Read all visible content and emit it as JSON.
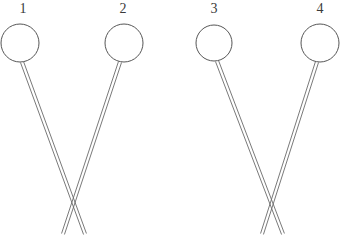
{
  "figure": {
    "background_color": "#ffffff",
    "stroke_color": "#565656",
    "stem_stroke_color": "#6a6a6a",
    "label_color": "#3a3a3a",
    "width": 356,
    "height": 235,
    "pins": [
      {
        "label": "1",
        "label_x": 17,
        "label_y": 2,
        "circle_cx": 20,
        "circle_cy": 43,
        "circle_r": 19,
        "stem_top_x": 22,
        "stem_top_y": 62,
        "stem_bottom_x": 85,
        "stem_bottom_y": 234,
        "stem_width": 3.2
      },
      {
        "label": "2",
        "label_x": 117,
        "label_y": 2,
        "circle_cx": 124,
        "circle_cy": 43,
        "circle_r": 19,
        "stem_top_x": 120,
        "stem_top_y": 62,
        "stem_bottom_x": 63,
        "stem_bottom_y": 234,
        "stem_width": 3.2
      },
      {
        "label": "3",
        "label_x": 208,
        "label_y": 2,
        "circle_cx": 214,
        "circle_cy": 43,
        "circle_r": 18,
        "stem_top_x": 217,
        "stem_top_y": 61,
        "stem_bottom_x": 283,
        "stem_bottom_y": 234,
        "stem_width": 3.2
      },
      {
        "label": "4",
        "label_x": 314,
        "label_y": 2,
        "circle_cx": 320,
        "circle_cy": 43,
        "circle_r": 19,
        "stem_top_x": 317,
        "stem_top_y": 62,
        "stem_bottom_x": 262,
        "stem_bottom_y": 234,
        "stem_width": 3.2
      }
    ],
    "crossings": [
      {
        "x": 72,
        "y": 213
      },
      {
        "x": 272,
        "y": 213
      }
    ]
  }
}
